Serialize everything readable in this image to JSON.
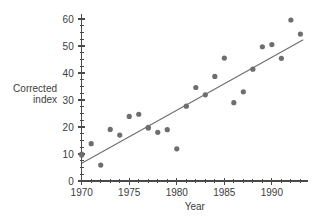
{
  "chart_data": {
    "type": "scatter",
    "title": "",
    "xlabel": "Year",
    "ylabel": "Corrected index",
    "ylabel_line1": "Corrected",
    "ylabel_line2": "index",
    "xlim": [
      1969.4,
      1993.8
    ],
    "ylim": [
      0,
      62
    ],
    "grid": false,
    "legend": null,
    "x_ticks_major": [
      1970,
      1975,
      1980,
      1985,
      1990
    ],
    "x_tick_labels": [
      "1970",
      "1975",
      "1980",
      "1985",
      "1990"
    ],
    "x_ticks_minor": [
      1971,
      1972,
      1973,
      1974,
      1976,
      1977,
      1978,
      1979,
      1981,
      1982,
      1983,
      1984,
      1986,
      1987,
      1988,
      1989,
      1991,
      1992,
      1993
    ],
    "y_ticks_major": [
      0,
      10,
      20,
      30,
      40,
      50,
      60
    ],
    "y_tick_labels": [
      "0",
      "10",
      "20",
      "30",
      "40",
      "50",
      "60"
    ],
    "y_ticks_minor": [
      2.5,
      5,
      7.5,
      12.5,
      15,
      17.5,
      22.5,
      25,
      27.5,
      32.5,
      35,
      37.5,
      42.5,
      45,
      47.5,
      52.5,
      55,
      57.5
    ],
    "point_color": "#6e6e6e",
    "line_color": "#6e6e6e",
    "axis_color": "#4a4a4a",
    "point_radius": 2.6,
    "x": [
      1970,
      1970,
      1971,
      1972,
      1973,
      1974,
      1975,
      1976,
      1977,
      1977,
      1978,
      1979,
      1980,
      1981,
      1982,
      1983,
      1984,
      1985,
      1986,
      1987,
      1988,
      1989,
      1990,
      1991,
      1992,
      1993
    ],
    "y": [
      10.0,
      9.6,
      13.8,
      5.9,
      19.1,
      17.0,
      23.9,
      24.7,
      19.9,
      19.6,
      18.0,
      19.0,
      11.9,
      27.7,
      34.6,
      31.9,
      38.7,
      45.5,
      29.0,
      33.0,
      41.4,
      49.7,
      50.5,
      45.4,
      59.6,
      54.4
    ],
    "trend_line": {
      "x_start": 1970,
      "y_start": 6.6,
      "x_end": 1993.3,
      "y_end": 52.3
    }
  }
}
